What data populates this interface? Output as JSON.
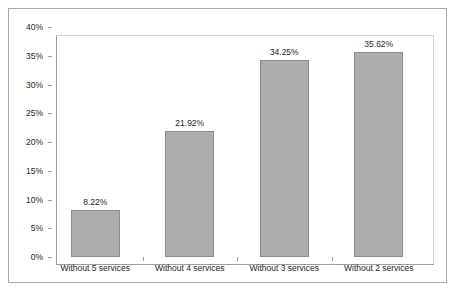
{
  "chart_data": {
    "type": "bar",
    "title": "",
    "subtitle": "",
    "xlabel": "",
    "ylabel": "",
    "categories": [
      "Without 5 services",
      "Without 4 services",
      "Without 3 services",
      "Without 2 services"
    ],
    "values": [
      8.22,
      21.92,
      34.25,
      35.62
    ],
    "data_labels": [
      "8.22%",
      "21.92%",
      "34.25%",
      "35.62%"
    ],
    "ylim": [
      0,
      40
    ],
    "ytick_values": [
      0,
      5,
      10,
      15,
      20,
      25,
      30,
      35,
      40
    ],
    "ytick_labels": [
      "0%",
      "5%",
      "10%",
      "15%",
      "20%",
      "25%",
      "30%",
      "35%",
      "40%"
    ],
    "grid": false,
    "legend": null,
    "legend_position": "none",
    "colors": {
      "bar_fill": "#adadad",
      "bar_border": "#8c8c8c",
      "axis_line": "#9e9e9e",
      "plot_border": "#d3d3d3",
      "outer_frame": "#a9a9a9",
      "text": "#231f20",
      "background": "#ffffff"
    }
  }
}
